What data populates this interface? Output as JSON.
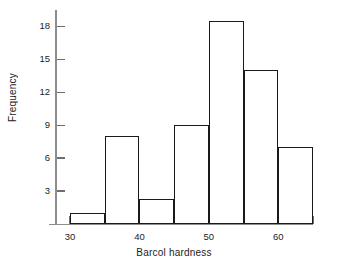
{
  "chart_data": {
    "type": "bar",
    "title": "",
    "subtitle": "",
    "xlabel": "Barcol hardness",
    "ylabel": "Frequency",
    "categories": [
      "30-35",
      "35-40",
      "40-45",
      "45-50",
      "50-55",
      "55-60",
      "60-65"
    ],
    "bin_edges": [
      30,
      35,
      40,
      45,
      50,
      55,
      60,
      65
    ],
    "bin_width": 5,
    "values": [
      1,
      8,
      2.3,
      9,
      18.5,
      14,
      7
    ],
    "xlim": [
      27.5,
      65.5
    ],
    "ylim": [
      0,
      19.5
    ],
    "xticks": [
      30,
      35,
      40,
      45,
      50,
      55,
      60,
      65
    ],
    "xtick_labels": [
      "30",
      "",
      "40",
      "",
      "50",
      "",
      "60",
      ""
    ],
    "yticks": [
      3,
      6,
      9,
      12,
      15,
      18
    ],
    "ytick_labels": [
      "3",
      "6",
      "9",
      "12",
      "15",
      "18"
    ],
    "grid": false,
    "legend": false,
    "legend_position": "none",
    "bar_fill": "none",
    "bar_edge_color": "#1a1a1a",
    "axis_color": "#8d8d8d",
    "background_color": "#ffffff",
    "annotations": []
  },
  "figure": {
    "xlabel": "Barcol hardness",
    "ylabel": "Frequency"
  }
}
